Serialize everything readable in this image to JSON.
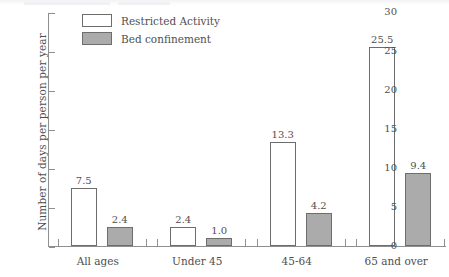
{
  "chart_data": {
    "type": "bar",
    "title": "",
    "xlabel": "",
    "ylabel": "Number of days per person per year",
    "ylim": [
      0,
      30
    ],
    "ytick_values": [
      0,
      5,
      10,
      15,
      20,
      25,
      30
    ],
    "ytick_labels": [
      "0",
      "5",
      "10",
      "15",
      "20",
      "25",
      "30"
    ],
    "grid": false,
    "legend_position": "top-left",
    "categories": [
      "All ages",
      "Under 45",
      "45-64",
      "65 and over"
    ],
    "series": [
      {
        "name": "Restricted Activity",
        "color": "#ffffff",
        "border_color": "#6d6d6d",
        "values": [
          7.5,
          2.4,
          13.3,
          25.5
        ],
        "labels": [
          "7.5",
          "2.4",
          "13.3",
          "25.5"
        ]
      },
      {
        "name": "Bed confinement",
        "color": "#ababab",
        "border_color": "#6d6d6d",
        "values": [
          2.4,
          1.0,
          4.2,
          9.4
        ],
        "labels": [
          "2.4",
          "1.0",
          "4.2",
          "9.4"
        ]
      }
    ]
  },
  "legend": {
    "items": [
      {
        "label": "Restricted Activity",
        "swatch": "restricted"
      },
      {
        "label": "Bed confinement",
        "swatch": "bed"
      }
    ]
  },
  "axes": {
    "y_label": "Number of days per person per year"
  }
}
